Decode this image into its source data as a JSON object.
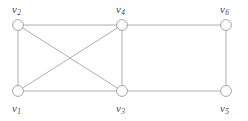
{
  "figure": {
    "kind": "undirected-graph-diagram",
    "background_color": "#ffffff",
    "edge_color": "#9a9a9a",
    "node_stroke_color": "#8f8f8f",
    "node_fill_color": "#ffffff",
    "label_color": "#4a4a4a",
    "node_radius": 5.4,
    "edge_width": 0.8
  },
  "graph_data": {
    "type": "graph",
    "directed": false,
    "node_count": 6,
    "edge_count": 9,
    "nodes": [
      {
        "id": "v1",
        "label": "v",
        "sub": "1",
        "x": 18,
        "y": 91,
        "label_x": 12,
        "label_y": 103
      },
      {
        "id": "v2",
        "label": "v",
        "sub": "2",
        "x": 18,
        "y": 25,
        "label_x": 12,
        "label_y": 4
      },
      {
        "id": "v3",
        "label": "v",
        "sub": "3",
        "x": 122,
        "y": 91,
        "label_x": 116,
        "label_y": 103
      },
      {
        "id": "v4",
        "label": "v",
        "sub": "4",
        "x": 122,
        "y": 25,
        "label_x": 116,
        "label_y": 4
      },
      {
        "id": "v5",
        "label": "v",
        "sub": "5",
        "x": 226,
        "y": 91,
        "label_x": 220,
        "label_y": 103
      },
      {
        "id": "v6",
        "label": "v",
        "sub": "6",
        "x": 226,
        "y": 25,
        "label_x": 220,
        "label_y": 4
      }
    ],
    "edges": [
      {
        "from": "v2",
        "to": "v4",
        "name": "edge-v2-v4"
      },
      {
        "from": "v4",
        "to": "v6",
        "name": "edge-v4-v6"
      },
      {
        "from": "v1",
        "to": "v3",
        "name": "edge-v1-v3"
      },
      {
        "from": "v3",
        "to": "v5",
        "name": "edge-v3-v5"
      },
      {
        "from": "v1",
        "to": "v2",
        "name": "edge-v1-v2"
      },
      {
        "from": "v3",
        "to": "v4",
        "name": "edge-v3-v4"
      },
      {
        "from": "v5",
        "to": "v6",
        "name": "edge-v5-v6"
      },
      {
        "from": "v1",
        "to": "v4",
        "name": "edge-v1-v4"
      },
      {
        "from": "v2",
        "to": "v3",
        "name": "edge-v2-v3"
      }
    ]
  }
}
